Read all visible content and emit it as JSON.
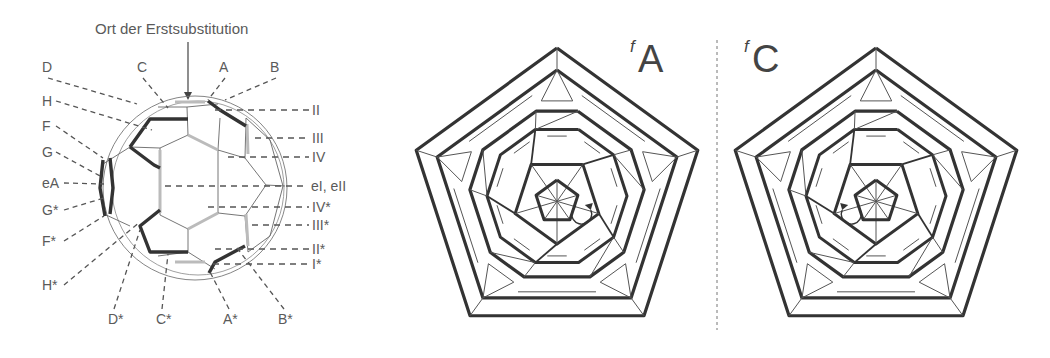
{
  "left_panel": {
    "title": "Ort der Erstsubstitution",
    "top_labels": [
      {
        "text": "D",
        "x": 42,
        "y": 72,
        "to": [
          137,
          104
        ]
      },
      {
        "text": "C",
        "x": 137,
        "y": 72,
        "to": [
          168,
          108
        ]
      },
      {
        "text": "A",
        "x": 219,
        "y": 72,
        "to": [
          208,
          100
        ]
      },
      {
        "text": "B",
        "x": 270,
        "y": 72,
        "to": [
          225,
          100
        ]
      }
    ],
    "left_labels": [
      {
        "text": "H",
        "x": 42,
        "y": 106,
        "to": [
          152,
          130
        ]
      },
      {
        "text": "F",
        "x": 42,
        "y": 131,
        "to": [
          103,
          158
        ]
      },
      {
        "text": "G",
        "x": 42,
        "y": 157,
        "to": [
          100,
          176
        ]
      },
      {
        "text": "eA",
        "x": 42,
        "y": 188,
        "to": [
          104,
          184
        ]
      },
      {
        "text": "G*",
        "x": 42,
        "y": 215,
        "to": [
          104,
          198
        ]
      },
      {
        "text": "F*",
        "x": 42,
        "y": 246,
        "to": [
          104,
          216
        ]
      },
      {
        "text": "H*",
        "x": 42,
        "y": 290,
        "to": [
          140,
          222
        ]
      }
    ],
    "right_labels": [
      {
        "text": "II",
        "x": 312,
        "y": 115,
        "from": [
          215,
          115
        ]
      },
      {
        "text": "III",
        "x": 312,
        "y": 143,
        "from": [
          255,
          143
        ]
      },
      {
        "text": "IV",
        "x": 312,
        "y": 162,
        "from": [
          228,
          162
        ]
      },
      {
        "text": "eI, eII",
        "x": 311,
        "y": 191,
        "from": [
          165,
          192
        ]
      },
      {
        "text": "IV*",
        "x": 312,
        "y": 212,
        "from": [
          208,
          212
        ]
      },
      {
        "text": "III*",
        "x": 312,
        "y": 230,
        "from": [
          252,
          230
        ]
      },
      {
        "text": "II*",
        "x": 312,
        "y": 254,
        "from": [
          215,
          254
        ]
      },
      {
        "text": "I*",
        "x": 312,
        "y": 269,
        "from": [
          213,
          269
        ]
      }
    ],
    "bottom_labels": [
      {
        "text": "D*",
        "x": 108,
        "y": 324,
        "to": [
          140,
          230
        ]
      },
      {
        "text": "C*",
        "x": 156,
        "y": 324,
        "to": [
          168,
          254
        ]
      },
      {
        "text": "A*",
        "x": 223,
        "y": 324,
        "to": [
          210,
          272
        ]
      },
      {
        "text": "B*",
        "x": 278,
        "y": 324,
        "to": [
          237,
          248
        ]
      }
    ],
    "sphere": {
      "cx": 195,
      "cy": 188,
      "rx": 92,
      "ry": 92
    }
  },
  "right_panels": [
    {
      "id": "fA",
      "superscript": "f",
      "letter": "A",
      "label_x": 638,
      "label_y": 72,
      "center": [
        557,
        196
      ],
      "scale": 1.0,
      "arrow": "clockwise",
      "ring_offset": 0.62
    },
    {
      "id": "fC",
      "superscript": "f",
      "letter": "C",
      "label_x": 752,
      "label_y": 72,
      "center": [
        876,
        196
      ],
      "scale": 1.0,
      "arrow": "counterclockwise",
      "ring_offset": -0.62
    }
  ],
  "divider": {
    "x": 717,
    "y1": 40,
    "y2": 330
  },
  "colors": {
    "bold": "#333333",
    "thin": "#555555",
    "dash": "#555555"
  }
}
